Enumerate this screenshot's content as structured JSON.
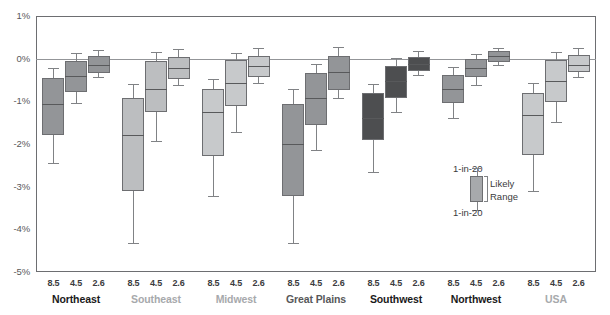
{
  "chart_data": {
    "type": "box",
    "title": "",
    "xlabel": "",
    "ylabel": "",
    "ylim": [
      -5,
      1
    ],
    "yticks": [
      "1%",
      "0%",
      "-1%",
      "-2%",
      "-3%",
      "-4%",
      "-5%"
    ],
    "ytick_values": [
      1,
      0,
      -1,
      -2,
      -3,
      -4,
      -5
    ],
    "grid": false,
    "zero_reference_line": 0,
    "scenarios": [
      "8.5",
      "4.5",
      "2.6"
    ],
    "groups": [
      {
        "name": "Northeast",
        "label_color": "#1a1a1a",
        "fill": "#939598",
        "boxes": [
          {
            "scenario": "8.5",
            "low": -2.45,
            "q1": -1.78,
            "median": -1.07,
            "q3": -0.46,
            "high": -0.22
          },
          {
            "scenario": "4.5",
            "low": -1.04,
            "q1": -0.77,
            "median": -0.4,
            "q3": -0.05,
            "high": 0.13
          },
          {
            "scenario": "2.6",
            "low": -0.43,
            "q1": -0.33,
            "median": -0.16,
            "q3": 0.06,
            "high": 0.2
          }
        ]
      },
      {
        "name": "Southeast",
        "label_color": "#a7a9ac",
        "fill": "#bcbec0",
        "boxes": [
          {
            "scenario": "8.5",
            "low": -4.32,
            "q1": -3.1,
            "median": -1.79,
            "q3": -0.92,
            "high": -0.6
          },
          {
            "scenario": "4.5",
            "low": -1.94,
            "q1": -1.25,
            "median": -0.72,
            "q3": -0.06,
            "high": 0.15
          },
          {
            "scenario": "2.6",
            "low": -0.62,
            "q1": -0.47,
            "median": -0.21,
            "q3": 0.04,
            "high": 0.22
          }
        ]
      },
      {
        "name": "Midwest",
        "label_color": "#a7a9ac",
        "fill": "#c7c9cb",
        "boxes": [
          {
            "scenario": "8.5",
            "low": -3.22,
            "q1": -2.28,
            "median": -1.25,
            "q3": -0.72,
            "high": -0.48
          },
          {
            "scenario": "4.5",
            "low": -1.71,
            "q1": -1.1,
            "median": -0.57,
            "q3": -0.03,
            "high": 0.14
          },
          {
            "scenario": "2.6",
            "low": -0.56,
            "q1": -0.42,
            "median": -0.18,
            "q3": 0.07,
            "high": 0.24
          }
        ]
      },
      {
        "name": "Great Plains",
        "label_color": "#58585a",
        "fill": "#939598",
        "boxes": [
          {
            "scenario": "8.5",
            "low": -4.33,
            "q1": -3.22,
            "median": -2.0,
            "q3": -1.06,
            "high": -0.72
          },
          {
            "scenario": "4.5",
            "low": -2.15,
            "q1": -1.55,
            "median": -0.92,
            "q3": -0.33,
            "high": -0.12
          },
          {
            "scenario": "2.6",
            "low": -0.92,
            "q1": -0.74,
            "median": -0.32,
            "q3": 0.06,
            "high": 0.28
          }
        ]
      },
      {
        "name": "Southwest",
        "label_color": "#1a1a1a",
        "fill": "#4d4e50",
        "boxes": [
          {
            "scenario": "8.5",
            "low": -2.66,
            "q1": -1.9,
            "median": -1.38,
            "q3": -0.8,
            "high": -0.59
          },
          {
            "scenario": "4.5",
            "low": -1.24,
            "q1": -0.92,
            "median": -0.52,
            "q3": -0.17,
            "high": 0.02
          },
          {
            "scenario": "2.6",
            "low": -0.38,
            "q1": -0.28,
            "median": -0.12,
            "q3": 0.04,
            "high": 0.17
          }
        ]
      },
      {
        "name": "Northwest",
        "label_color": "#1a1a1a",
        "fill": "#939598",
        "boxes": [
          {
            "scenario": "8.5",
            "low": -1.4,
            "q1": -1.03,
            "median": -0.7,
            "q3": -0.38,
            "high": -0.2
          },
          {
            "scenario": "4.5",
            "low": -0.62,
            "q1": -0.44,
            "median": -0.22,
            "q3": -0.01,
            "high": 0.12
          },
          {
            "scenario": "2.6",
            "low": -0.16,
            "q1": -0.08,
            "median": 0.06,
            "q3": 0.18,
            "high": 0.26
          }
        ]
      },
      {
        "name": "USA",
        "label_color": "#a7a9ac",
        "fill": "#c7c9cb",
        "boxes": [
          {
            "scenario": "8.5",
            "low": -3.1,
            "q1": -2.26,
            "median": -1.33,
            "q3": -0.8,
            "high": -0.58
          },
          {
            "scenario": "4.5",
            "low": -1.48,
            "q1": -1.02,
            "median": -0.52,
            "q3": -0.02,
            "high": 0.16
          },
          {
            "scenario": "2.6",
            "low": -0.44,
            "q1": -0.32,
            "median": -0.14,
            "q3": 0.08,
            "high": 0.26
          }
        ]
      }
    ]
  },
  "legend": {
    "top_label": "1-in-20",
    "middle_label_line1": "Likely",
    "middle_label_line2": "Range",
    "bottom_label": "1-in-20"
  },
  "colors": {
    "frame": "#6d6e71",
    "zero_line": "#939598",
    "axis_text": "#58585a",
    "whisker": "#808285",
    "median": "#58595b"
  }
}
